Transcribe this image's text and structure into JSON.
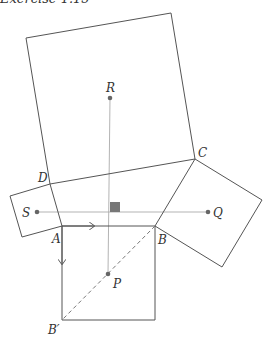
{
  "title": "Exercise 1.15",
  "colors": {
    "stroke": "#555555",
    "guide": "#aaaaaa",
    "marker": "#777777",
    "point": "#666666"
  },
  "points": {
    "A": {
      "label": "A",
      "x": 62,
      "y": 226
    },
    "B": {
      "label": "B",
      "x": 155,
      "y": 226
    },
    "C": {
      "label": "C",
      "x": 195,
      "y": 159
    },
    "D": {
      "label": "D",
      "x": 50,
      "y": 184
    },
    "B_prime": {
      "label": "B′",
      "x": 62,
      "y": 320
    },
    "P": {
      "label": "P",
      "x": 108,
      "y": 274
    },
    "Q": {
      "label": "Q",
      "x": 208,
      "y": 212
    },
    "R": {
      "label": "R",
      "x": 110,
      "y": 98
    },
    "S": {
      "label": "S",
      "x": 37,
      "y": 212
    }
  },
  "shapes": {
    "big_square": "26,38 171,13 195,159 50,184",
    "left_square": "10,196 50,184 62,226 22,237",
    "right_square": "195,159 262,200 222,267 155,226",
    "bottom_square": "62,226 155,226 155,320 62,320"
  }
}
